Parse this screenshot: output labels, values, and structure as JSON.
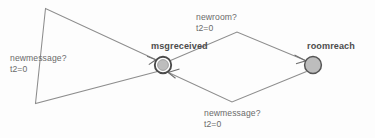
{
  "diagram": {
    "type": "state-machine",
    "background_color": "#fdfdfd",
    "edge_color": "#8d8d8d",
    "node_fill_color": "#bdbdbd",
    "node_stroke_color": "#4a4a4a",
    "label_color": "#6a6a6a",
    "node_label_color": "#4c4c4c",
    "nodes": [
      {
        "id": "msgreceived",
        "label": "msgreceived",
        "shape": "double-circle",
        "cx": 163,
        "cy": 65,
        "r_outer": 8.2,
        "r_inner": 5.4
      },
      {
        "id": "roomreach",
        "label": "roomreach",
        "shape": "circle",
        "cx": 313,
        "cy": 65,
        "r_outer": 8.4
      }
    ],
    "edges": [
      {
        "id": "self-loop-msgreceived",
        "from": "msgreceived",
        "to": "msgreceived",
        "guard": "newmessage?",
        "action": "t2=0",
        "label_line1": "newmessage?",
        "label_line2": "t2=0"
      },
      {
        "id": "msgreceived-to-roomreach",
        "from": "msgreceived",
        "to": "roomreach",
        "guard": "newroom?",
        "action": "t2=0",
        "label_line1": "newroom?",
        "label_line2": "t2=0"
      },
      {
        "id": "roomreach-to-msgreceived",
        "from": "roomreach",
        "to": "msgreceived",
        "guard": "newmessage?",
        "action": "t2=0",
        "label_line1": "newmessage?",
        "label_line2": "t2=0"
      }
    ]
  }
}
